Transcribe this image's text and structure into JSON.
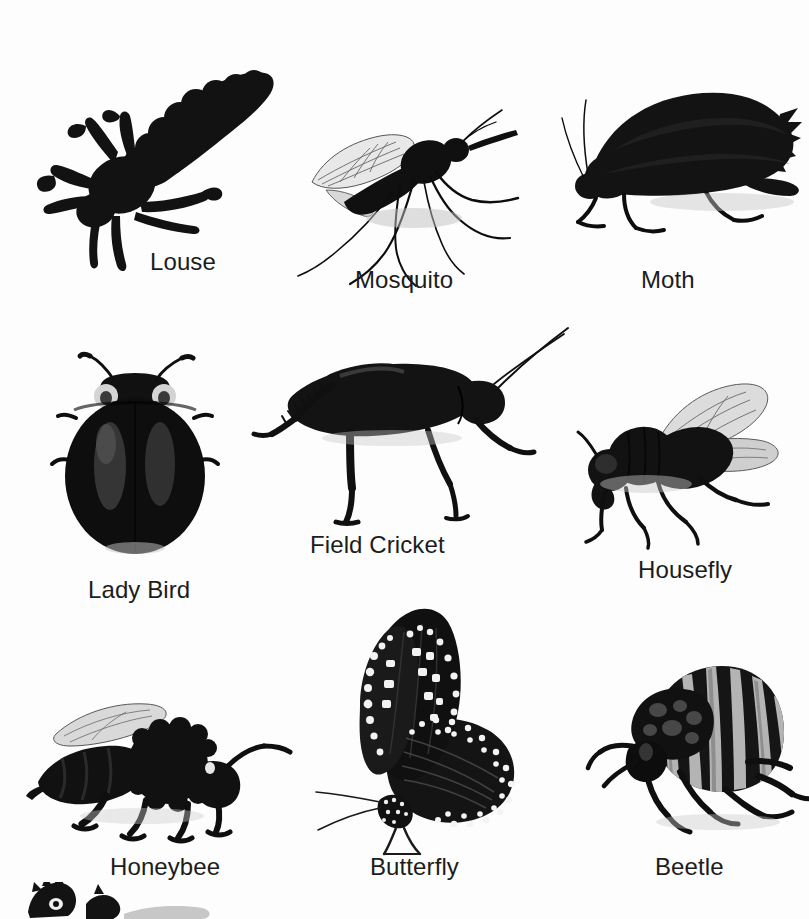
{
  "page": {
    "kind": "insect-identification-chart",
    "background_color": "#fdfdfd",
    "ink_color": "#1c1c1c",
    "width": 809,
    "height": 919,
    "columns": 3,
    "rows": 3
  },
  "specimens": [
    {
      "id": "louse",
      "label": "Louse",
      "row": 1,
      "column": 1,
      "image_box": {
        "x": 30,
        "y": 52,
        "w": 250,
        "h": 200
      },
      "label_pos": {
        "x": 150,
        "y": 250
      }
    },
    {
      "id": "mosquito",
      "label": "Mosquito",
      "row": 1,
      "column": 2,
      "image_box": {
        "x": 296,
        "y": 86,
        "w": 246,
        "h": 182
      },
      "label_pos": {
        "x": 355,
        "y": 268
      }
    },
    {
      "id": "moth",
      "label": "Moth",
      "row": 1,
      "column": 3,
      "image_box": {
        "x": 552,
        "y": 74,
        "w": 250,
        "h": 176
      },
      "label_pos": {
        "x": 641,
        "y": 268
      }
    },
    {
      "id": "lady-bird",
      "label": "Lady Bird",
      "row": 2,
      "column": 1,
      "image_box": {
        "x": 48,
        "y": 348,
        "w": 174,
        "h": 212
      },
      "label_pos": {
        "x": 88,
        "y": 578
      }
    },
    {
      "id": "field-cricket",
      "label": "Field Cricket",
      "row": 2,
      "column": 2,
      "image_box": {
        "x": 232,
        "y": 326,
        "w": 312,
        "h": 202
      },
      "label_pos": {
        "x": 310,
        "y": 533
      }
    },
    {
      "id": "housefly",
      "label": "Housefly",
      "row": 2,
      "column": 3,
      "image_box": {
        "x": 566,
        "y": 378,
        "w": 228,
        "h": 164
      },
      "label_pos": {
        "x": 638,
        "y": 558
      }
    },
    {
      "id": "honeybee",
      "label": "Honeybee",
      "row": 3,
      "column": 1,
      "image_box": {
        "x": 22,
        "y": 690,
        "w": 272,
        "h": 146
      },
      "label_pos": {
        "x": 110,
        "y": 855
      }
    },
    {
      "id": "butterfly",
      "label": "Butterfly",
      "row": 3,
      "column": 2,
      "image_box": {
        "x": 326,
        "y": 602,
        "w": 200,
        "h": 238
      },
      "label_pos": {
        "x": 370,
        "y": 855
      }
    },
    {
      "id": "beetle",
      "label": "Beetle",
      "row": 3,
      "column": 3,
      "image_box": {
        "x": 598,
        "y": 652,
        "w": 200,
        "h": 182
      },
      "label_pos": {
        "x": 655,
        "y": 855
      }
    }
  ],
  "partial_specimen": {
    "id": "unlabeled-bottom-left",
    "label": "",
    "note": "cut off at bottom edge of frame",
    "image_box": {
      "x": 20,
      "y": 882,
      "w": 190,
      "h": 37
    }
  }
}
